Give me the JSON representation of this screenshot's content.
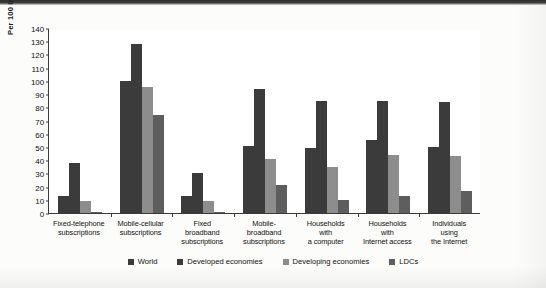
{
  "chart_data": {
    "type": "bar",
    "title": "",
    "xlabel": "",
    "ylabel": "Per 100 inhabitants/households",
    "ylim": [
      0,
      140
    ],
    "ytick_step": 10,
    "yticks": [
      "140",
      "130",
      "120",
      "110",
      "100",
      "90",
      "80",
      "70",
      "60",
      "50",
      "40",
      "30",
      "20",
      "10",
      "0"
    ],
    "grid": false,
    "legend_position": "bottom",
    "categories": [
      "Fixed-telephone subscriptions",
      "Mobile-cellular subscriptions",
      "Fixed broadband subscriptions",
      "Mobile-broadband subscriptions",
      "Households with a computer",
      "Households with Internet access",
      "Individuals using the Internet"
    ],
    "category_lines": [
      [
        "Fixed-telephone",
        "subscriptions"
      ],
      [
        "Mobile-cellular",
        "subscriptions"
      ],
      [
        "Fixed",
        "broadband",
        "subscriptions"
      ],
      [
        "Mobile-",
        "broadband",
        "subscriptions"
      ],
      [
        "Households",
        "with",
        "a computer"
      ],
      [
        "Households",
        "with",
        "Internet access"
      ],
      [
        "Individuals",
        "using",
        "the Internet"
      ]
    ],
    "series": [
      {
        "name": "World",
        "color": "#3b3b3b",
        "values": [
          13,
          100,
          13,
          51,
          49,
          55,
          50
        ]
      },
      {
        "name": "Developed economies",
        "color": "#3b3b3b",
        "values": [
          38,
          128,
          30,
          94,
          85,
          85,
          84
        ]
      },
      {
        "name": "Developing economies",
        "color": "#8d8d8d",
        "values": [
          9,
          95,
          9,
          41,
          35,
          44,
          43
        ]
      },
      {
        "name": "LDCs",
        "color": "#5e5e5e",
        "values": [
          1,
          74,
          1,
          21,
          10,
          13,
          17
        ]
      }
    ]
  },
  "legend": {
    "items": [
      {
        "label": "World",
        "color": "#3b3b3b"
      },
      {
        "label": "Developed economies",
        "color": "#3b3b3b"
      },
      {
        "label": "Developing economies",
        "color": "#8d8d8d"
      },
      {
        "label": "LDCs",
        "color": "#5e5e5e"
      }
    ]
  }
}
